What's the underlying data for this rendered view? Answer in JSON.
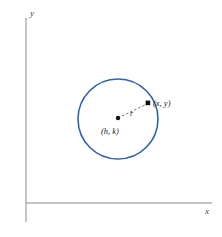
{
  "figure": {
    "background_color": "#ffffff",
    "axes": {
      "x_label": "x",
      "y_label": "y",
      "axis_color": "#808080",
      "origin": {
        "x": 26,
        "y": 203
      },
      "x_axis_end": {
        "x": 212,
        "y": 203
      },
      "y_axis_end": {
        "x": 26,
        "y": 18
      }
    },
    "circle": {
      "color": "#2f62ab",
      "center": {
        "x": 118,
        "y": 119
      },
      "radius": 40,
      "stroke_width": 1.6
    },
    "center_point": {
      "label": "(h, k)",
      "marker_color": "#111111",
      "x": 118,
      "y": 118
    },
    "circumference_point": {
      "label": "(x, y)",
      "marker_color": "#111111",
      "x": 148,
      "y": 103
    },
    "radius_segment": {
      "label": "r",
      "style": "dashed",
      "color": "#4a4a4a"
    }
  }
}
